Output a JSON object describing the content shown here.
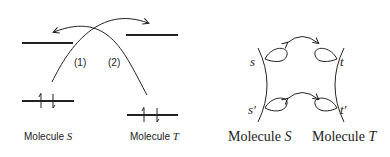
{
  "left_panel": {
    "curve_labels": [
      "(1)",
      "(2)"
    ],
    "molecule_labels": [
      {
        "prefix": "Molecule ",
        "name": "S"
      },
      {
        "prefix": "Molecule ",
        "name": "T"
      }
    ]
  },
  "right_panel": {
    "orbital_labels": {
      "s": "s",
      "t": "t",
      "s_prime": "s′",
      "t_prime": "t′"
    },
    "molecule_labels": [
      {
        "prefix": "Molecule ",
        "name": "S"
      },
      {
        "prefix": "Molecule ",
        "name": "T"
      }
    ]
  }
}
